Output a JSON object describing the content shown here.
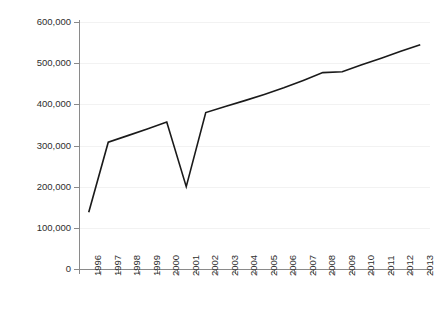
{
  "chart_data": {
    "type": "line",
    "title": "",
    "subtitle": "",
    "xlabel": "",
    "ylabel": "",
    "categories": [
      "1996",
      "1997",
      "1998",
      "1999",
      "2000",
      "2001",
      "2002",
      "2003",
      "2004",
      "2005",
      "2006",
      "2007",
      "2008",
      "2009",
      "2010",
      "2011",
      "2012",
      "2013"
    ],
    "series": [
      {
        "name": "",
        "values": [
          138000,
          308000,
          324000,
          340000,
          357000,
          200000,
          380000,
          395000,
          409000,
          424000,
          440000,
          458000,
          477000,
          479000,
          496000,
          512000,
          529000,
          545000
        ]
      }
    ],
    "ylim": [
      0,
      600000
    ],
    "y_ticks": [
      0,
      100000,
      200000,
      300000,
      400000,
      500000,
      600000
    ],
    "y_tick_labels": [
      "0",
      "100,000",
      "200,000",
      "300,000",
      "400,000",
      "500,000",
      "600,000"
    ],
    "grid": true,
    "grid_axis": "y",
    "legend": "none",
    "line_color": "#1a1a1a",
    "grid_color": "#f2f2f2",
    "axis_color": "#8a8a8a",
    "text_color": "#2e2e2e",
    "background_color": "#ffffff"
  }
}
